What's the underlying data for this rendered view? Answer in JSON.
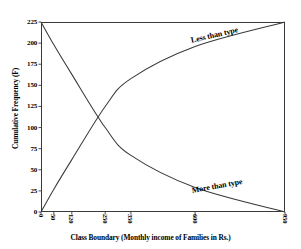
{
  "chart_data": {
    "type": "line",
    "title": "",
    "xlabel": "Class Boundary (Monthly income of Families in Rs.)",
    "ylabel": "Cumulative Frequency (F)",
    "xlim": [
      0,
      950
    ],
    "ylim": [
      0,
      225
    ],
    "grid": false,
    "legend_position": "inline-annotations",
    "x_tick_labels": [
      "0",
      "50",
      "120",
      "250",
      "350",
      "600",
      "950"
    ],
    "x_tick_values": [
      0,
      50,
      120,
      250,
      350,
      600,
      950
    ],
    "y_tick_labels": [
      "0",
      "25",
      "50",
      "75",
      "100",
      "125",
      "150",
      "175",
      "200",
      "225"
    ],
    "y_tick_values": [
      0,
      25,
      50,
      75,
      100,
      125,
      150,
      175,
      200,
      225
    ],
    "series": [
      {
        "name": "Less than type",
        "x": [
          0,
          50,
          120,
          250,
          350,
          600,
          950
        ],
        "values": [
          0,
          27,
          62,
          125,
          158,
          196,
          225
        ]
      },
      {
        "name": "More than type",
        "x": [
          0,
          50,
          120,
          250,
          350,
          600,
          950
        ],
        "values": [
          225,
          198,
          163,
          100,
          67,
          29,
          0
        ]
      }
    ],
    "annotations": [
      {
        "text": "Less than type",
        "x": 600,
        "y": 200
      },
      {
        "text": "More than type",
        "x": 600,
        "y": 25
      }
    ],
    "intersection": {
      "x": 160,
      "y": 110
    },
    "colors": {
      "line": "#3a3a3a",
      "frame": "#3a3a3a",
      "background": "#ffffff",
      "text": "#000000"
    }
  }
}
